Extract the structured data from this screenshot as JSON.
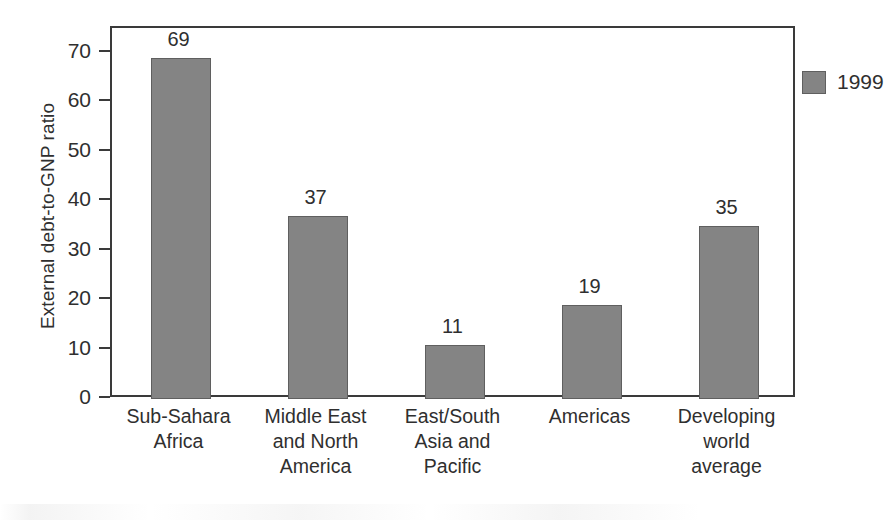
{
  "chart_data": {
    "type": "bar",
    "title": "",
    "xlabel": "",
    "ylabel": "External debt-to-GNP ratio",
    "ylim": [
      0,
      75
    ],
    "ytick_values": [
      0,
      10,
      20,
      30,
      40,
      50,
      60,
      70
    ],
    "ytick_labels": [
      "0",
      "10",
      "20",
      "30",
      "40",
      "50",
      "60",
      "70"
    ],
    "grid": false,
    "legend_position": "top-right",
    "categories": [
      "Sub-Sahara Africa",
      "Middle East and North America",
      "East/South Asia and Pacific",
      "Americas",
      "Developing world average"
    ],
    "category_label_lines": [
      [
        "Sub-Sahara",
        "Africa"
      ],
      [
        "Middle East",
        "and North",
        "America"
      ],
      [
        "East/South",
        "Asia and",
        "Pacific"
      ],
      [
        "Americas"
      ],
      [
        "Developing",
        "world",
        "average"
      ]
    ],
    "series": [
      {
        "name": "1999",
        "color": "#848484",
        "values": [
          69,
          37,
          11,
          19,
          35
        ],
        "value_labels": [
          "69",
          "37",
          "11",
          "19",
          "35"
        ]
      }
    ],
    "legend": [
      {
        "label": "1999",
        "color": "#848484"
      }
    ],
    "colors": {
      "bar_fill": "#848484",
      "bar_stroke": "#5f5f5f",
      "axis": "#3a3a3a",
      "text": "#2f2f2f",
      "background": "#ffffff"
    }
  }
}
